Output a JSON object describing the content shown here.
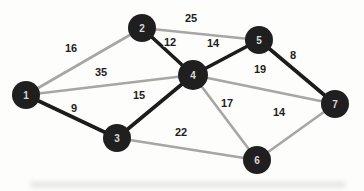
{
  "diagram": {
    "type": "weighted-undirected-graph",
    "canvas": {
      "width": 364,
      "height": 191,
      "background": "#fdfdfc"
    },
    "colors": {
      "node_fill": "#1f1f1f",
      "node_text": "#d8d8d8",
      "edge_normal": "#a6a6a6",
      "edge_highlight": "#1c1c1c",
      "weight_text": "#1d1d1d"
    },
    "stroke_widths": {
      "normal": 2.6,
      "highlight": 3.6
    },
    "nodes": [
      {
        "id": "1",
        "x": 26,
        "y": 95,
        "r": 14
      },
      {
        "id": "2",
        "x": 142,
        "y": 28,
        "r": 14
      },
      {
        "id": "3",
        "x": 117,
        "y": 138,
        "r": 14
      },
      {
        "id": "4",
        "x": 193,
        "y": 75,
        "r": 15
      },
      {
        "id": "5",
        "x": 259,
        "y": 40,
        "r": 14
      },
      {
        "id": "6",
        "x": 257,
        "y": 160,
        "r": 14
      },
      {
        "id": "7",
        "x": 335,
        "y": 104,
        "r": 14
      }
    ],
    "edges": [
      {
        "from": "1",
        "to": "2",
        "weight": "16",
        "style": "normal",
        "label_x": 71,
        "label_y": 48
      },
      {
        "from": "1",
        "to": "4",
        "weight": "35",
        "style": "normal",
        "label_x": 101,
        "label_y": 72
      },
      {
        "from": "2",
        "to": "5",
        "weight": "25",
        "style": "normal",
        "label_x": 191,
        "label_y": 18
      },
      {
        "from": "4",
        "to": "7",
        "weight": "19",
        "style": "normal",
        "label_x": 260,
        "label_y": 69
      },
      {
        "from": "4",
        "to": "6",
        "weight": "17",
        "style": "normal",
        "label_x": 227,
        "label_y": 103
      },
      {
        "from": "3",
        "to": "6",
        "weight": "22",
        "style": "normal",
        "label_x": 181,
        "label_y": 132
      },
      {
        "from": "6",
        "to": "7",
        "weight": "14",
        "style": "normal",
        "label_x": 279,
        "label_y": 112
      },
      {
        "from": "1",
        "to": "3",
        "weight": "9",
        "style": "highlight",
        "label_x": 74,
        "label_y": 108
      },
      {
        "from": "2",
        "to": "4",
        "weight": "12",
        "style": "highlight",
        "label_x": 170,
        "label_y": 42
      },
      {
        "from": "3",
        "to": "4",
        "weight": "15",
        "style": "highlight",
        "label_x": 139,
        "label_y": 95
      },
      {
        "from": "4",
        "to": "5",
        "weight": "14",
        "style": "highlight",
        "label_x": 213,
        "label_y": 43
      },
      {
        "from": "5",
        "to": "7",
        "weight": "8",
        "style": "highlight",
        "label_x": 293,
        "label_y": 55
      }
    ]
  }
}
